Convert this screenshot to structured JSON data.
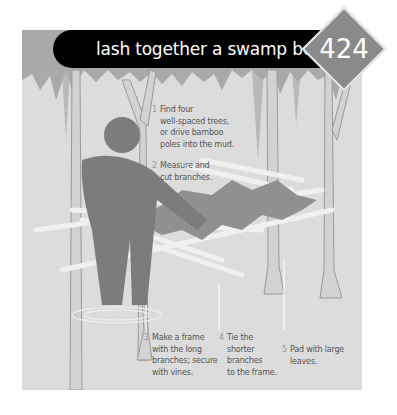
{
  "title": "lash together a swamp bed",
  "badge_number": "424",
  "colors": {
    "panel_bg": "#dcdcdc",
    "title_bar": "#000000",
    "badge": "#8a8a8a",
    "foliage": "#a8a8a8",
    "figure": "#7c7c7c",
    "text": "#555555"
  },
  "steps": [
    {
      "num": "1",
      "lines": [
        "Find four",
        "well-spaced trees,",
        "or drive bamboo",
        "poles into the mud."
      ]
    },
    {
      "num": "2",
      "lines": [
        "Measure and",
        "cut branches."
      ]
    },
    {
      "num": "3",
      "lines": [
        "Make a frame",
        "with the long",
        "branches; secure",
        "with vines."
      ]
    },
    {
      "num": "4",
      "lines": [
        "Tie the",
        "shorter",
        "branches",
        "to the frame."
      ]
    },
    {
      "num": "5",
      "lines": [
        "Pad with large",
        "leaves."
      ]
    }
  ],
  "illustration": {
    "subject": "person building swamp bed between trees",
    "icons": [
      "person-figure",
      "tree-trunks",
      "branch-frame",
      "leaf-pile",
      "foliage-canopy"
    ]
  }
}
